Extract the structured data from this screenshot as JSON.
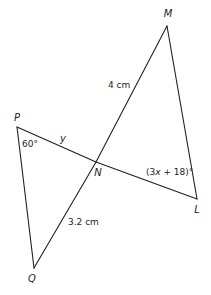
{
  "diagram": {
    "vertices": {
      "M": {
        "label": "M",
        "x": 167,
        "y": 26,
        "lx": 168,
        "ly": 17
      },
      "P": {
        "label": "P",
        "x": 17,
        "y": 127,
        "lx": 17,
        "ly": 121
      },
      "N": {
        "label": "N",
        "x": 96,
        "y": 162,
        "lx": 98,
        "ly": 176
      },
      "L": {
        "label": "L",
        "x": 197,
        "y": 199,
        "lx": 197,
        "ly": 213
      },
      "Q": {
        "label": "Q",
        "x": 34,
        "y": 268,
        "lx": 32,
        "ly": 282
      }
    },
    "segments": [
      "P-N",
      "N-L",
      "M-N",
      "N-Q",
      "P-Q",
      "M-L"
    ],
    "annotations": {
      "mn_length": "4 cm",
      "nq_length": "3.2 cm",
      "angle_p": "60°",
      "pn_variable": "y",
      "angle_l_expr_a": "(3",
      "angle_l_expr_x": "x",
      "angle_l_expr_b": " + 18)°"
    },
    "stroke_color": "#231f20",
    "background": "#ffffff"
  }
}
